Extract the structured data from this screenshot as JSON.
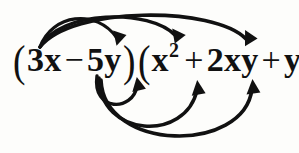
{
  "colors": {
    "background": "#fdfdfb",
    "ink": "#111111",
    "arrow": "#111111"
  },
  "canvas": {
    "width": 299,
    "height": 153
  },
  "expression": {
    "full_text": "(3x - 5y)(x^2 + 2xy + y^2)",
    "left_factor": {
      "open_paren": "(",
      "terms": [
        {
          "text": "3x",
          "sign": ""
        },
        {
          "text": "5y",
          "sign": "−"
        }
      ],
      "close_paren": ")"
    },
    "right_factor": {
      "open_paren": "(",
      "terms": [
        {
          "base": "x",
          "exponent": "2",
          "sign": ""
        },
        {
          "base": "2xy",
          "exponent": "",
          "sign": "+"
        },
        {
          "base": "y",
          "exponent": "2",
          "sign": "+"
        }
      ],
      "close_paren": ")"
    },
    "tokens": {
      "open1": "(",
      "t1": "3x",
      "minus": "−",
      "t2": "5y",
      "close1": ")",
      "open2": "(",
      "t3": "x",
      "t3_sup": "2",
      "plus1": "+",
      "t4": "2xy",
      "plus2": "+",
      "t5": "y",
      "t5_sup": "2",
      "close2": ")"
    }
  },
  "arrows": [
    {
      "id": "arrow-3x-to-x2",
      "from": "3x",
      "to": "x^2",
      "position": "above",
      "path": "M 40 47 C 52 14, 96 8, 117 38",
      "head": {
        "x": 118,
        "y": 44,
        "angle": 70
      },
      "width": 3.2
    },
    {
      "id": "arrow-3x-to-2xy",
      "from": "3x",
      "to": "2xy",
      "position": "above",
      "path": "M 40 47 C 60 10, 150 8, 176 36",
      "head": {
        "x": 177,
        "y": 42,
        "angle": 62
      },
      "width": 3.4
    },
    {
      "id": "arrow-3x-to-y2",
      "from": "3x",
      "to": "y^2",
      "position": "above",
      "path": "M 40 47 C 72 6, 214 6, 246 39",
      "head": {
        "x": 248,
        "y": 45,
        "angle": 55
      },
      "width": 3.6
    },
    {
      "id": "arrow-5y-to-x2",
      "from": "5y",
      "to": "x^2",
      "position": "below",
      "path": "M 97 76 C 92 112, 133 112, 137 86",
      "head": {
        "x": 138,
        "y": 79,
        "angle": -80
      },
      "width": 3.4
    },
    {
      "id": "arrow-5y-to-2xy",
      "from": "5y",
      "to": "2xy",
      "position": "below",
      "path": "M 99 78 C 100 138, 186 142, 197 90",
      "head": {
        "x": 198,
        "y": 82,
        "angle": -82
      },
      "width": 3.6
    },
    {
      "id": "arrow-5y-to-y2",
      "from": "5y",
      "to": "y^2",
      "position": "below",
      "path": "M 101 80 C 104 152, 244 154, 252 89",
      "head": {
        "x": 253,
        "y": 81,
        "angle": -85
      },
      "width": 3.6
    }
  ]
}
